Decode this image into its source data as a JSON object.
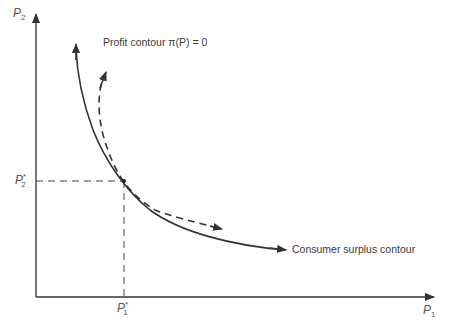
{
  "diagram": {
    "axes": {
      "x_label": "P",
      "x_sub": "1",
      "y_label": "P",
      "y_sub": "2"
    },
    "optimum": {
      "x_label": "P",
      "x_sub": "1",
      "x_sup": "*",
      "y_label": "P",
      "y_sub": "2",
      "y_sup": "*"
    },
    "curves": [
      {
        "name": "Profit contour",
        "label": "Profit contour  π(P) = 0",
        "style": "dashed"
      },
      {
        "name": "Consumer surplus contour",
        "label": "Consumer surplus contour",
        "style": "solid"
      }
    ]
  }
}
